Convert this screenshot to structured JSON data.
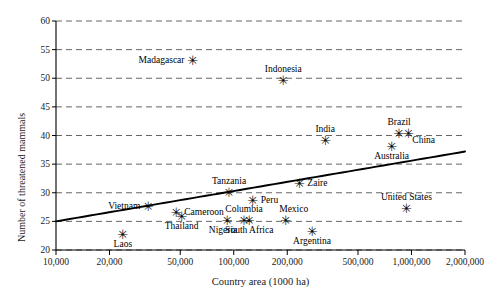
{
  "chart_data": {
    "type": "scatter",
    "title": "",
    "xlabel": "Country area (1000 ha)",
    "ylabel": "Number of threatened mammals",
    "xscale": "log",
    "xlim": [
      10000,
      2000000
    ],
    "ylim": [
      20,
      60
    ],
    "xticks": [
      10000,
      20000,
      50000,
      100000,
      200000,
      500000,
      1000000,
      2000000
    ],
    "xtick_labels": [
      "10,000",
      "20,000",
      "50,000",
      "100,000",
      "200,000",
      "500,000",
      "1,000,000",
      "2,000,000"
    ],
    "yticks": [
      20,
      25,
      30,
      35,
      40,
      45,
      50,
      55,
      60
    ],
    "ytick_labels": [
      "20",
      "25",
      "30",
      "35",
      "40",
      "45",
      "50",
      "55",
      "60"
    ],
    "grid": "horizontal-dashed",
    "legend": "none",
    "marker": "six-pointed-asterisk",
    "marker_glyph": "✳",
    "point_color": "#000000",
    "line_color": "#000000",
    "grid_color": "#555555",
    "points": [
      {
        "label": "Madagascar",
        "x": 58700,
        "y": 53.0,
        "label_pos": "left"
      },
      {
        "label": "Indonesia",
        "x": 190000,
        "y": 49.5,
        "label_pos": "above"
      },
      {
        "label": "Brazil",
        "x": 851000,
        "y": 40.2,
        "label_pos": "above"
      },
      {
        "label": "China",
        "x": 960000,
        "y": 40.2,
        "label_pos": "below-right"
      },
      {
        "label": "India",
        "x": 328000,
        "y": 39.0,
        "label_pos": "above"
      },
      {
        "label": "Australia",
        "x": 774000,
        "y": 38.0,
        "label_pos": "below"
      },
      {
        "label": "Zaire",
        "x": 234000,
        "y": 31.5,
        "label_pos": "right"
      },
      {
        "label": "Tanzania",
        "x": 94000,
        "y": 30.0,
        "label_pos": "above"
      },
      {
        "label": "Peru",
        "x": 128000,
        "y": 28.5,
        "label_pos": "right"
      },
      {
        "label": "Vietnam",
        "x": 33000,
        "y": 27.5,
        "label_pos": "left"
      },
      {
        "label": "United States",
        "x": 937000,
        "y": 27.2,
        "label_pos": "above"
      },
      {
        "label": "Cameroon",
        "x": 47500,
        "y": 26.5,
        "label_pos": "right"
      },
      {
        "label": "Thailand",
        "x": 51000,
        "y": 25.8,
        "label_pos": "below"
      },
      {
        "label": "Columbia",
        "x": 114000,
        "y": 25.0,
        "label_pos": "above"
      },
      {
        "label": "Mexico",
        "x": 196000,
        "y": 25.0,
        "label_pos": "above-right"
      },
      {
        "label": "Nigeria",
        "x": 92000,
        "y": 25.0,
        "label_pos": "below-left"
      },
      {
        "label": "South Africa",
        "x": 122000,
        "y": 25.0,
        "label_pos": "below"
      },
      {
        "label": "Argentina",
        "x": 276000,
        "y": 23.2,
        "label_pos": "below"
      },
      {
        "label": "Laos",
        "x": 23700,
        "y": 22.7,
        "label_pos": "below"
      }
    ],
    "trend_line": {
      "type": "log-linear-fit",
      "x_start": 10000,
      "y_start": 25.0,
      "x_end": 2000000,
      "y_end": 37.2
    }
  }
}
